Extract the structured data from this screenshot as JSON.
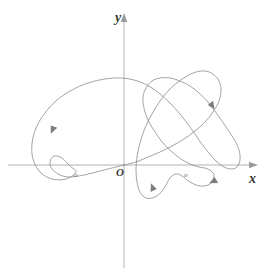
{
  "figure": {
    "title": "",
    "background_color": "#ffffff",
    "axis_color": "#b3b3b3",
    "curve_color": "#8c8c8c",
    "label_color": "#3a3a3a",
    "marker_label_color": "#6a6a6a",
    "axes": {
      "origin": {
        "x": 124,
        "y": 165
      },
      "x_axis": {
        "label": "x",
        "start_x": 8,
        "end_x": 258,
        "y": 165,
        "arrow": "right"
      },
      "y_axis": {
        "label": "y",
        "x": 124,
        "start_y": 268,
        "end_y": 13,
        "arrow": "up"
      },
      "origin_label": "O"
    },
    "markers": [
      {
        "label": "o",
        "x": 78,
        "y": 176
      },
      {
        "label": "o",
        "x": 188,
        "y": 176
      }
    ],
    "direction_arrows": [
      {
        "x": 52,
        "y": 131,
        "angle": -58
      },
      {
        "x": 213,
        "y": 107,
        "angle": -118
      },
      {
        "x": 152,
        "y": 186,
        "angle": 62
      },
      {
        "x": 212,
        "y": 182,
        "angle": 20
      }
    ]
  },
  "chart_data": {
    "type": "line",
    "title": "",
    "xlabel": "x",
    "ylabel": "y",
    "grid": false,
    "legend": "none",
    "xlim": [
      -120,
      135
    ],
    "ylim": [
      -105,
      155
    ],
    "series": [
      {
        "name": "parametric-curve",
        "closed": true,
        "path_points": [
          [
            124,
            165
          ],
          [
            104,
            170
          ],
          [
            84,
            175
          ],
          [
            70,
            177
          ],
          [
            60,
            175
          ],
          [
            52,
            169
          ],
          [
            50,
            162
          ],
          [
            54,
            156
          ],
          [
            62,
            158
          ],
          [
            70,
            166
          ],
          [
            76,
            172
          ],
          [
            66,
            179
          ],
          [
            52,
            179
          ],
          [
            40,
            172
          ],
          [
            33,
            159
          ],
          [
            32,
            144
          ],
          [
            36,
            128
          ],
          [
            45,
            113
          ],
          [
            57,
            100
          ],
          [
            72,
            90
          ],
          [
            88,
            83
          ],
          [
            105,
            79
          ],
          [
            120,
            78
          ],
          [
            134,
            80
          ],
          [
            147,
            85
          ],
          [
            159,
            93
          ],
          [
            170,
            103
          ],
          [
            180,
            114
          ],
          [
            190,
            127
          ],
          [
            199,
            140
          ],
          [
            208,
            152
          ],
          [
            216,
            161
          ],
          [
            224,
            167
          ],
          [
            231,
            169
          ],
          [
            237,
            167
          ],
          [
            240,
            160
          ],
          [
            239,
            150
          ],
          [
            234,
            139
          ],
          [
            226,
            127
          ],
          [
            217,
            114
          ],
          [
            208,
            102
          ],
          [
            199,
            93
          ],
          [
            190,
            86
          ],
          [
            180,
            81
          ],
          [
            170,
            78
          ],
          [
            160,
            78
          ],
          [
            152,
            81
          ],
          [
            146,
            88
          ],
          [
            143,
            97
          ],
          [
            144,
            108
          ],
          [
            148,
            120
          ],
          [
            155,
            132
          ],
          [
            163,
            143
          ],
          [
            172,
            152
          ],
          [
            181,
            159
          ],
          [
            190,
            164
          ],
          [
            199,
            167
          ],
          [
            208,
            169
          ],
          [
            214,
            175
          ],
          [
            210,
            184
          ],
          [
            200,
            186
          ],
          [
            190,
            182
          ],
          [
            182,
            176
          ],
          [
            176,
            174
          ],
          [
            170,
            178
          ],
          [
            163,
            190
          ],
          [
            155,
            197
          ],
          [
            146,
            198
          ],
          [
            140,
            192
          ],
          [
            137,
            182
          ],
          [
            136,
            170
          ],
          [
            137,
            157
          ],
          [
            140,
            143
          ],
          [
            145,
            128
          ],
          [
            152,
            114
          ],
          [
            160,
            101
          ],
          [
            169,
            90
          ],
          [
            178,
            82
          ],
          [
            187,
            76
          ],
          [
            196,
            72
          ],
          [
            205,
            71
          ],
          [
            213,
            74
          ],
          [
            219,
            81
          ],
          [
            221,
            90
          ],
          [
            219,
            101
          ],
          [
            213,
            112
          ],
          [
            205,
            122
          ],
          [
            195,
            131
          ],
          [
            184,
            139
          ],
          [
            172,
            146
          ],
          [
            160,
            152
          ],
          [
            148,
            157
          ],
          [
            136,
            162
          ],
          [
            124,
            165
          ]
        ]
      }
    ]
  }
}
